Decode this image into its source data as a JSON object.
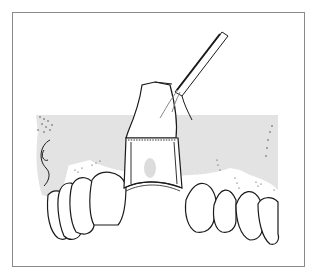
{
  "figure": {
    "colors": {
      "frame": "#8a8a8a",
      "gum_shade": "#e2e2e2",
      "line": "#1a1a1a",
      "background": "#ffffff"
    }
  }
}
